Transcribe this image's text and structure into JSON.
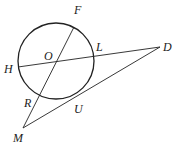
{
  "diagram": {
    "type": "geometry",
    "circle": {
      "center": "O",
      "cx": 56,
      "cy": 61,
      "r": 38
    },
    "points": {
      "F": {
        "x": 74,
        "y": 27,
        "label": "F",
        "lx": 74,
        "ly": 14
      },
      "O": {
        "x": 56,
        "y": 61,
        "label": "O",
        "lx": 44,
        "ly": 60
      },
      "L": {
        "x": 93,
        "y": 56,
        "label": "L",
        "lx": 96,
        "ly": 51
      },
      "H": {
        "x": 18,
        "y": 67,
        "label": "H",
        "lx": 4,
        "ly": 73
      },
      "D": {
        "x": 160,
        "y": 47,
        "label": "D",
        "lx": 163,
        "ly": 51
      },
      "R": {
        "x": 38,
        "y": 95,
        "label": "R",
        "lx": 24,
        "ly": 107
      },
      "U": {
        "x": 72,
        "y": 99,
        "label": "U",
        "lx": 74,
        "ly": 113
      },
      "M": {
        "x": 23,
        "y": 128,
        "label": "M",
        "lx": 13,
        "ly": 142
      }
    },
    "segments": [
      {
        "from": "F",
        "to": "M"
      },
      {
        "from": "H",
        "to": "D"
      },
      {
        "from": "M",
        "to": "D"
      }
    ],
    "colors": {
      "stroke": "#222222",
      "background": "#ffffff"
    }
  }
}
